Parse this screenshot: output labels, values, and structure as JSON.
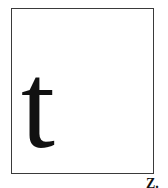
{
  "glyph_box": {
    "character": "t",
    "border_color": "#3a3a3a",
    "glyph_color": "#111111"
  },
  "corner_label": {
    "text": "Z."
  }
}
